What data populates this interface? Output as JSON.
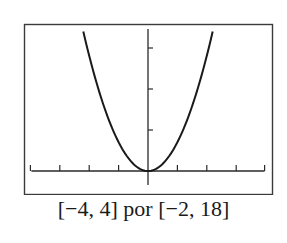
{
  "chart_data": {
    "type": "line",
    "title": "",
    "caption": "[−4, 4] por [−2, 18]",
    "xlabel": "",
    "ylabel": "",
    "xlim": [
      -4,
      4
    ],
    "ylim": [
      -2,
      18
    ],
    "x_ticks": [
      -4,
      -3,
      -2,
      -1,
      1,
      2,
      3,
      4
    ],
    "y_ticks": [
      5,
      10,
      15
    ],
    "tick_labels_shown": false,
    "grid": false,
    "legend": null,
    "series": [
      {
        "name": "parabola",
        "function": "y = a*x^2, a ≈ 3.5",
        "x": [
          -2.2,
          -2.0,
          -1.5,
          -1.0,
          -0.5,
          0,
          0.5,
          1.0,
          1.5,
          2.0,
          2.2
        ],
        "y": [
          17.0,
          14.0,
          7.9,
          3.5,
          0.9,
          0,
          0.9,
          3.5,
          7.9,
          14.0,
          17.0
        ]
      }
    ],
    "colors": {
      "axes": "#2a2a2a",
      "curve": "#1a1a1a",
      "frame": "#3a3a3a"
    }
  }
}
